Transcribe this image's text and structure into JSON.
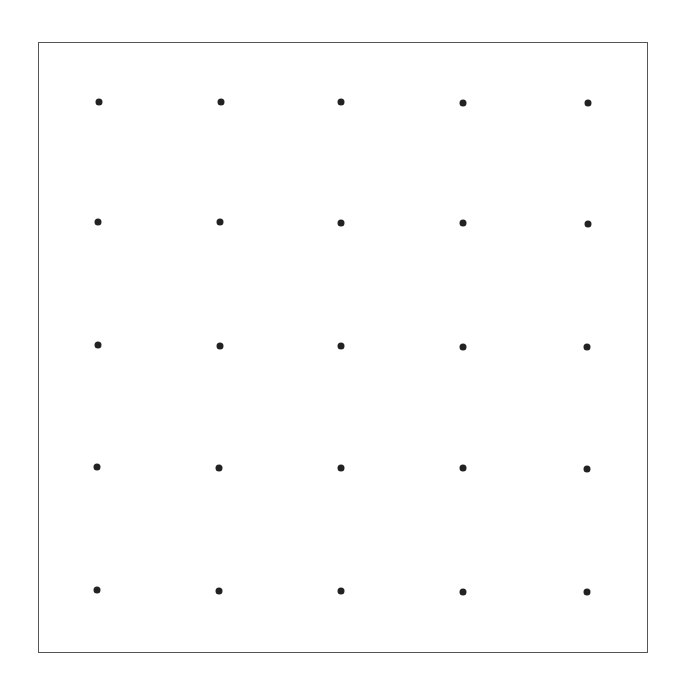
{
  "diagram": {
    "type": "dot-grid",
    "rows": 5,
    "cols": 5,
    "dot_color": "#222222",
    "frame_color": "#555555",
    "dots": [
      [
        {
          "x": 99,
          "y": 102
        },
        {
          "x": 221,
          "y": 102
        },
        {
          "x": 341,
          "y": 102
        },
        {
          "x": 463,
          "y": 103
        },
        {
          "x": 588,
          "y": 103
        }
      ],
      [
        {
          "x": 98,
          "y": 222
        },
        {
          "x": 220,
          "y": 222
        },
        {
          "x": 341,
          "y": 223
        },
        {
          "x": 463,
          "y": 223
        },
        {
          "x": 588,
          "y": 224
        }
      ],
      [
        {
          "x": 98,
          "y": 345
        },
        {
          "x": 220,
          "y": 346
        },
        {
          "x": 341,
          "y": 346
        },
        {
          "x": 463,
          "y": 347
        },
        {
          "x": 587,
          "y": 347
        }
      ],
      [
        {
          "x": 97,
          "y": 467
        },
        {
          "x": 219,
          "y": 468
        },
        {
          "x": 341,
          "y": 468
        },
        {
          "x": 463,
          "y": 468
        },
        {
          "x": 587,
          "y": 469
        }
      ],
      [
        {
          "x": 97,
          "y": 590
        },
        {
          "x": 219,
          "y": 591
        },
        {
          "x": 341,
          "y": 591
        },
        {
          "x": 463,
          "y": 592
        },
        {
          "x": 587,
          "y": 592
        }
      ]
    ]
  }
}
